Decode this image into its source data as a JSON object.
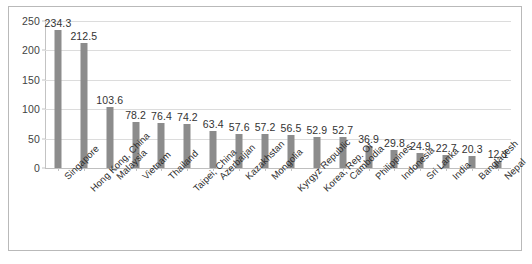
{
  "chart_data": {
    "type": "bar",
    "title": "",
    "subtitle": "",
    "xlabel": "",
    "ylabel": "",
    "ylim": [
      0,
      250
    ],
    "yticks": [
      0,
      50,
      100,
      150,
      200,
      250
    ],
    "ytick_labels": [
      "0",
      "50",
      "100",
      "150",
      "200",
      "250"
    ],
    "grid": true,
    "legend": "none",
    "orientation": "vertical",
    "bar_color": "#8c8c8c",
    "show_data_labels": true,
    "categories": [
      "Singapore",
      "Hong Kong, China",
      "Malaysia",
      "Vietnam",
      "Thailand",
      "Taipei, China",
      "Azerbaijan",
      "Kazakhstan",
      "Mongolia",
      "Kyrgyz Republic",
      "Korea, Rep. Of",
      "Cambodia",
      "Philippines",
      "Indonesia",
      "Sri Lanka",
      "India",
      "Bangladesh",
      "Nepal"
    ],
    "values": [
      234.3,
      212.5,
      103.6,
      78.2,
      76.4,
      74.2,
      63.4,
      57.6,
      57.2,
      56.5,
      52.9,
      52.7,
      36.9,
      29.8,
      24.9,
      22.7,
      20.3,
      12.1
    ],
    "data_labels": [
      "234.3",
      "212.5",
      "103.6",
      "78.2",
      "76.4",
      "74.2",
      "63.4",
      "57.6",
      "57.2",
      "56.5",
      "52.9",
      "52.7",
      "36.9",
      "29.8",
      "24.9",
      "22.7",
      "20.3",
      "12.1"
    ]
  },
  "figure": {
    "border_color": "#b9b9b9",
    "background": "#ffffff",
    "bottom_clipped_text": ""
  }
}
